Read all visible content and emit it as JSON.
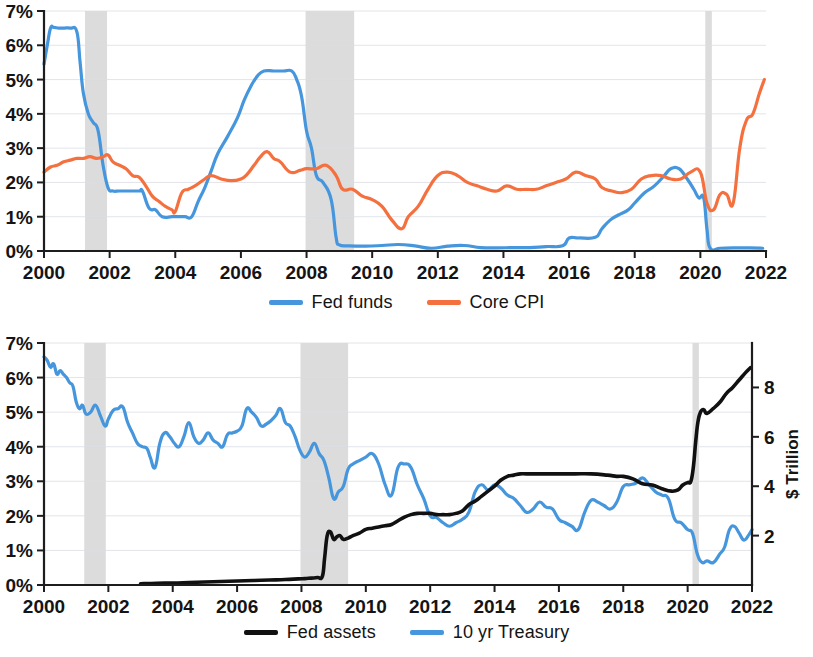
{
  "figure": {
    "background": "#ffffff",
    "recession_color": "#d6d6d6",
    "gridline_color": "#d9dde3",
    "axis_color": "#1d1d1d"
  },
  "colors": {
    "fed_funds": "#4596dd",
    "core_cpi": "#f4703f",
    "fed_assets": "#111111",
    "treasury_10yr": "#4596dd"
  },
  "legend_top": {
    "items": [
      {
        "label": "Fed funds",
        "color": "#4596dd"
      },
      {
        "label": "Core CPI",
        "color": "#f4703f"
      }
    ]
  },
  "legend_bottom": {
    "items": [
      {
        "label": "Fed assets",
        "color": "#111111"
      },
      {
        "label": "10 yr Treasury",
        "color": "#4596dd"
      }
    ]
  },
  "chart_data": [
    {
      "id": "rates-panel",
      "type": "line",
      "title": "",
      "xlabel": "",
      "ylabel": "",
      "grid": true,
      "legend_position": "bottom",
      "xlim": [
        2000,
        2022
      ],
      "ylim": [
        0,
        7
      ],
      "x_ticks": [
        2000,
        2002,
        2004,
        2006,
        2008,
        2010,
        2012,
        2014,
        2016,
        2018,
        2020,
        2022
      ],
      "x_tick_labels": [
        "2000",
        "2002",
        "2004",
        "2006",
        "2008",
        "2010",
        "2012",
        "2014",
        "2016",
        "2018",
        "2020",
        "2022"
      ],
      "y_ticks": [
        0,
        1,
        2,
        3,
        4,
        5,
        6,
        7
      ],
      "y_tick_labels": [
        "0%",
        "1%",
        "2%",
        "3%",
        "4%",
        "5%",
        "6%",
        "7%"
      ],
      "recession_bands": [
        {
          "start": 2001.25,
          "end": 2001.92
        },
        {
          "start": 2007.97,
          "end": 2009.45
        },
        {
          "start": 2020.15,
          "end": 2020.35
        }
      ],
      "series": [
        {
          "name": "Fed funds",
          "color": "#4596dd",
          "x": [
            2000.0,
            2000.1,
            2000.2,
            2000.3,
            2000.45,
            2000.6,
            2000.8,
            2001.0,
            2001.1,
            2001.2,
            2001.35,
            2001.5,
            2001.65,
            2001.8,
            2001.95,
            2002.1,
            2002.3,
            2002.6,
            2002.9,
            2003.0,
            2003.2,
            2003.4,
            2003.6,
            2003.9,
            2004.1,
            2004.3,
            2004.5,
            2004.7,
            2004.9,
            2005.1,
            2005.3,
            2005.6,
            2005.9,
            2006.1,
            2006.3,
            2006.5,
            2006.7,
            2007.0,
            2007.3,
            2007.55,
            2007.7,
            2007.85,
            2008.0,
            2008.15,
            2008.3,
            2008.5,
            2008.75,
            2008.9,
            2009.0,
            2009.3,
            2009.8,
            2010.3,
            2010.8,
            2011.3,
            2011.8,
            2012.3,
            2012.8,
            2013.3,
            2013.8,
            2014.3,
            2014.8,
            2015.3,
            2015.8,
            2016.0,
            2016.3,
            2016.8,
            2017.0,
            2017.25,
            2017.5,
            2017.8,
            2018.0,
            2018.3,
            2018.6,
            2018.9,
            2019.1,
            2019.35,
            2019.6,
            2019.8,
            2019.95,
            2020.1,
            2020.2,
            2020.3,
            2020.6,
            2021.0,
            2021.5,
            2021.9
          ],
          "y": [
            5.45,
            6.0,
            6.5,
            6.52,
            6.5,
            6.5,
            6.5,
            6.4,
            5.5,
            4.6,
            4.0,
            3.75,
            3.5,
            2.5,
            1.85,
            1.75,
            1.75,
            1.75,
            1.75,
            1.75,
            1.25,
            1.2,
            1.0,
            1.0,
            1.0,
            1.0,
            1.0,
            1.45,
            1.85,
            2.35,
            2.85,
            3.35,
            3.9,
            4.4,
            4.8,
            5.1,
            5.25,
            5.25,
            5.25,
            5.25,
            5.0,
            4.5,
            3.5,
            3.0,
            2.2,
            2.0,
            1.5,
            0.4,
            0.18,
            0.15,
            0.14,
            0.16,
            0.19,
            0.15,
            0.08,
            0.14,
            0.16,
            0.1,
            0.09,
            0.1,
            0.1,
            0.13,
            0.15,
            0.38,
            0.38,
            0.4,
            0.65,
            0.9,
            1.05,
            1.2,
            1.4,
            1.7,
            1.9,
            2.2,
            2.4,
            2.4,
            2.1,
            1.8,
            1.55,
            1.55,
            0.65,
            0.08,
            0.08,
            0.09,
            0.09,
            0.08
          ]
        },
        {
          "name": "Core CPI",
          "color": "#f4703f",
          "x": [
            2000.0,
            2000.2,
            2000.4,
            2000.6,
            2000.8,
            2001.0,
            2001.2,
            2001.4,
            2001.6,
            2001.8,
            2001.95,
            2002.1,
            2002.3,
            2002.5,
            2002.7,
            2002.9,
            2003.1,
            2003.3,
            2003.5,
            2003.7,
            2003.9,
            2004.0,
            2004.2,
            2004.4,
            2004.6,
            2004.9,
            2005.1,
            2005.4,
            2005.7,
            2006.0,
            2006.2,
            2006.4,
            2006.6,
            2006.8,
            2007.0,
            2007.2,
            2007.5,
            2007.8,
            2008.0,
            2008.3,
            2008.6,
            2008.9,
            2009.1,
            2009.4,
            2009.7,
            2010.0,
            2010.3,
            2010.6,
            2010.9,
            2011.1,
            2011.4,
            2011.7,
            2012.0,
            2012.3,
            2012.6,
            2012.9,
            2013.2,
            2013.5,
            2013.8,
            2014.1,
            2014.4,
            2014.7,
            2015.0,
            2015.3,
            2015.6,
            2015.9,
            2016.2,
            2016.5,
            2016.8,
            2017.0,
            2017.3,
            2017.6,
            2017.9,
            2018.2,
            2018.5,
            2018.8,
            2019.1,
            2019.4,
            2019.7,
            2020.0,
            2020.2,
            2020.4,
            2020.6,
            2020.8,
            2021.0,
            2021.2,
            2021.4,
            2021.6,
            2021.8,
            2021.95
          ],
          "y": [
            2.3,
            2.45,
            2.5,
            2.6,
            2.65,
            2.7,
            2.7,
            2.75,
            2.7,
            2.75,
            2.8,
            2.6,
            2.5,
            2.4,
            2.2,
            2.15,
            1.9,
            1.6,
            1.45,
            1.3,
            1.2,
            1.15,
            1.7,
            1.8,
            1.9,
            2.1,
            2.2,
            2.1,
            2.05,
            2.1,
            2.25,
            2.5,
            2.75,
            2.9,
            2.7,
            2.6,
            2.3,
            2.35,
            2.4,
            2.4,
            2.5,
            2.2,
            1.8,
            1.8,
            1.6,
            1.5,
            1.3,
            0.9,
            0.65,
            1.0,
            1.3,
            1.8,
            2.2,
            2.3,
            2.2,
            2.0,
            1.9,
            1.8,
            1.75,
            1.9,
            1.8,
            1.8,
            1.8,
            1.9,
            2.0,
            2.1,
            2.3,
            2.2,
            2.1,
            1.85,
            1.75,
            1.7,
            1.8,
            2.1,
            2.2,
            2.2,
            2.1,
            2.1,
            2.3,
            2.3,
            1.4,
            1.2,
            1.65,
            1.65,
            1.4,
            3.0,
            3.8,
            4.0,
            4.6,
            5.0
          ]
        }
      ]
    },
    {
      "id": "assets-panel",
      "type": "line",
      "title": "",
      "xlabel": "",
      "ylabel_right": "$ Trillion",
      "grid": true,
      "legend_position": "bottom",
      "xlim": [
        2000,
        2022
      ],
      "ylim_left": [
        0,
        7
      ],
      "ylim_right": [
        0,
        9.8
      ],
      "x_ticks": [
        2000,
        2002,
        2004,
        2006,
        2008,
        2010,
        2012,
        2014,
        2016,
        2018,
        2020,
        2022
      ],
      "x_tick_labels": [
        "2000",
        "2002",
        "2004",
        "2006",
        "2008",
        "2010",
        "2012",
        "2014",
        "2016",
        "2018",
        "2020",
        "2022"
      ],
      "y_ticks_left": [
        0,
        1,
        2,
        3,
        4,
        5,
        6,
        7
      ],
      "y_tick_labels_left": [
        "0%",
        "1%",
        "2%",
        "3%",
        "4%",
        "5%",
        "6%",
        "7%"
      ],
      "y_ticks_right": [
        2,
        4,
        6,
        8
      ],
      "y_tick_labels_right": [
        "2",
        "4",
        "6",
        "8"
      ],
      "recession_bands": [
        {
          "start": 2001.25,
          "end": 2001.92
        },
        {
          "start": 2007.97,
          "end": 2009.45
        },
        {
          "start": 2020.15,
          "end": 2020.35
        }
      ],
      "series": [
        {
          "name": "10 yr Treasury",
          "axis": "left",
          "unit": "percent",
          "color": "#4596dd",
          "x": [
            2000.0,
            2000.1,
            2000.2,
            2000.3,
            2000.4,
            2000.5,
            2000.6,
            2000.7,
            2000.8,
            2000.9,
            2001.0,
            2001.1,
            2001.2,
            2001.3,
            2001.45,
            2001.6,
            2001.75,
            2001.9,
            2002.0,
            2002.15,
            2002.3,
            2002.45,
            2002.6,
            2002.75,
            2002.9,
            2003.05,
            2003.2,
            2003.3,
            2003.45,
            2003.6,
            2003.75,
            2003.9,
            2004.05,
            2004.2,
            2004.35,
            2004.5,
            2004.65,
            2004.8,
            2004.95,
            2005.1,
            2005.25,
            2005.4,
            2005.55,
            2005.7,
            2005.85,
            2006.0,
            2006.15,
            2006.3,
            2006.45,
            2006.6,
            2006.75,
            2006.9,
            2007.05,
            2007.2,
            2007.35,
            2007.5,
            2007.65,
            2007.8,
            2007.95,
            2008.1,
            2008.25,
            2008.4,
            2008.55,
            2008.7,
            2008.85,
            2009.0,
            2009.15,
            2009.3,
            2009.45,
            2009.6,
            2009.8,
            2010.0,
            2010.2,
            2010.4,
            2010.6,
            2010.8,
            2011.0,
            2011.2,
            2011.4,
            2011.6,
            2011.8,
            2012.0,
            2012.2,
            2012.4,
            2012.6,
            2012.8,
            2013.0,
            2013.2,
            2013.4,
            2013.6,
            2013.8,
            2014.0,
            2014.2,
            2014.4,
            2014.6,
            2014.8,
            2015.0,
            2015.2,
            2015.4,
            2015.6,
            2015.8,
            2016.0,
            2016.2,
            2016.4,
            2016.6,
            2016.8,
            2017.0,
            2017.2,
            2017.4,
            2017.6,
            2017.8,
            2018.0,
            2018.2,
            2018.4,
            2018.6,
            2018.8,
            2019.0,
            2019.2,
            2019.4,
            2019.6,
            2019.8,
            2020.0,
            2020.15,
            2020.3,
            2020.45,
            2020.6,
            2020.8,
            2021.0,
            2021.15,
            2021.3,
            2021.45,
            2021.6,
            2021.75,
            2021.9,
            2022.0
          ],
          "y": [
            6.6,
            6.5,
            6.3,
            6.4,
            6.1,
            6.2,
            6.1,
            6.0,
            5.85,
            5.75,
            5.3,
            5.1,
            5.2,
            4.95,
            5.0,
            5.2,
            4.9,
            4.6,
            4.8,
            5.05,
            5.1,
            5.15,
            4.7,
            4.4,
            4.1,
            4.0,
            3.95,
            3.7,
            3.4,
            4.1,
            4.4,
            4.3,
            4.1,
            4.0,
            4.3,
            4.7,
            4.3,
            4.1,
            4.2,
            4.4,
            4.2,
            4.1,
            4.0,
            4.35,
            4.4,
            4.45,
            4.6,
            5.1,
            5.0,
            4.85,
            4.6,
            4.65,
            4.75,
            4.9,
            5.1,
            4.7,
            4.6,
            4.3,
            3.9,
            3.7,
            3.85,
            4.1,
            3.8,
            3.6,
            3.1,
            2.5,
            2.7,
            2.85,
            3.35,
            3.5,
            3.6,
            3.7,
            3.8,
            3.5,
            2.9,
            2.6,
            3.4,
            3.5,
            3.4,
            2.9,
            2.5,
            2.0,
            1.95,
            1.8,
            1.7,
            1.8,
            1.9,
            2.1,
            2.7,
            2.9,
            2.75,
            2.9,
            2.8,
            2.6,
            2.5,
            2.3,
            2.1,
            2.2,
            2.4,
            2.25,
            2.2,
            1.9,
            1.8,
            1.7,
            1.6,
            2.1,
            2.45,
            2.4,
            2.3,
            2.2,
            2.4,
            2.85,
            2.9,
            2.95,
            3.1,
            2.9,
            2.7,
            2.6,
            2.5,
            1.9,
            1.8,
            1.6,
            1.5,
            0.9,
            0.65,
            0.7,
            0.65,
            0.9,
            1.1,
            1.6,
            1.7,
            1.5,
            1.3,
            1.45,
            1.6,
            1.5,
            1.75
          ]
        },
        {
          "name": "Fed assets",
          "axis": "right",
          "unit": "trillion",
          "color": "#111111",
          "x": [
            2003.0,
            2003.5,
            2004.0,
            2004.5,
            2005.0,
            2005.5,
            2006.0,
            2006.5,
            2007.0,
            2007.5,
            2007.9,
            2008.1,
            2008.3,
            2008.5,
            2008.65,
            2008.72,
            2008.8,
            2008.9,
            2009.0,
            2009.1,
            2009.2,
            2009.3,
            2009.45,
            2009.6,
            2009.8,
            2010.0,
            2010.2,
            2010.4,
            2010.6,
            2010.8,
            2011.0,
            2011.2,
            2011.4,
            2011.6,
            2011.8,
            2012.0,
            2012.2,
            2012.4,
            2012.6,
            2012.8,
            2013.0,
            2013.2,
            2013.4,
            2013.6,
            2013.8,
            2014.0,
            2014.2,
            2014.4,
            2014.6,
            2014.8,
            2015.0,
            2015.5,
            2016.0,
            2016.5,
            2017.0,
            2017.5,
            2017.8,
            2018.0,
            2018.3,
            2018.6,
            2018.9,
            2019.2,
            2019.5,
            2019.7,
            2019.85,
            2020.0,
            2020.1,
            2020.18,
            2020.25,
            2020.32,
            2020.4,
            2020.5,
            2020.6,
            2020.8,
            2021.0,
            2021.2,
            2021.4,
            2021.6,
            2021.8,
            2021.95
          ],
          "y": [
            0.05,
            0.07,
            0.08,
            0.1,
            0.12,
            0.14,
            0.16,
            0.18,
            0.2,
            0.22,
            0.25,
            0.26,
            0.28,
            0.3,
            0.35,
            1.1,
            2.0,
            2.15,
            1.85,
            1.95,
            2.0,
            1.85,
            1.9,
            2.0,
            2.1,
            2.25,
            2.3,
            2.35,
            2.4,
            2.45,
            2.6,
            2.75,
            2.85,
            2.9,
            2.9,
            2.9,
            2.85,
            2.85,
            2.85,
            2.9,
            3.0,
            3.25,
            3.4,
            3.6,
            3.8,
            4.0,
            4.25,
            4.4,
            4.45,
            4.5,
            4.5,
            4.5,
            4.5,
            4.5,
            4.5,
            4.45,
            4.4,
            4.4,
            4.3,
            4.1,
            4.05,
            3.9,
            3.8,
            3.85,
            4.05,
            4.15,
            4.2,
            4.8,
            5.8,
            6.6,
            7.0,
            7.1,
            6.95,
            7.15,
            7.4,
            7.75,
            8.0,
            8.3,
            8.6,
            8.8
          ]
        }
      ]
    }
  ]
}
